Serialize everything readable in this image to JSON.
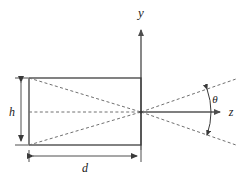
{
  "figure": {
    "type": "geometry-diagram",
    "background_color": "#ffffff",
    "line_color": "#4d4d4d",
    "dashed_color": "#6b6b6b",
    "text_color": "#1a1a1a"
  },
  "axes": {
    "vertical": {
      "label": "y",
      "icon": "arrow-up-icon",
      "label_x": 141,
      "label_y": 16,
      "x": 141,
      "y_start": 150,
      "y_end": 28
    },
    "horizontal": {
      "label": "z",
      "icon": "arrow-right-icon",
      "label_x": 232,
      "label_y": 113,
      "y": 112,
      "x_start": 141,
      "x_end": 222
    }
  },
  "rectangle": {
    "name": "source-rectangle",
    "left": 29,
    "top": 78,
    "right": 141,
    "bottom": 145,
    "width": 112,
    "height": 67
  },
  "focal_point": {
    "x": 141,
    "y": 112
  },
  "dimensions": [
    {
      "name": "height-dimension",
      "label": "h",
      "orientation": "vertical",
      "x": 21,
      "from": 78,
      "to": 145,
      "label_x": 12,
      "label_y": 115
    },
    {
      "name": "depth-dimension",
      "label": "d",
      "orientation": "horizontal",
      "y": 156,
      "from": 29,
      "to": 141,
      "label_x": 85,
      "label_y": 171
    }
  ],
  "angle": {
    "label": "θ",
    "label_x": 214,
    "label_y": 100,
    "arc_center_x": 141,
    "arc_center_y": 112,
    "arc_radius": 70,
    "half_angle_deg": 19
  },
  "rays": [
    {
      "name": "ray-top-left-to-focus",
      "x1": 29,
      "y1": 78,
      "x2": 141,
      "y2": 112
    },
    {
      "name": "ray-bottom-left-to-focus",
      "x1": 29,
      "y1": 145,
      "x2": 141,
      "y2": 112
    },
    {
      "name": "ray-center-line",
      "x1": 29,
      "y1": 112,
      "x2": 141,
      "y2": 112
    },
    {
      "name": "ray-focus-to-upper-right",
      "x1": 141,
      "y1": 112,
      "x2": 234,
      "y2": 80
    },
    {
      "name": "ray-focus-to-lower-right",
      "x1": 141,
      "y1": 112,
      "x2": 234,
      "y2": 144
    }
  ]
}
